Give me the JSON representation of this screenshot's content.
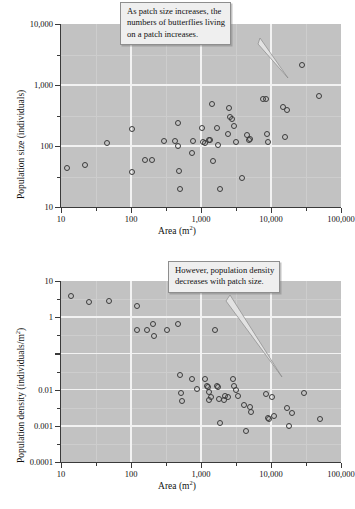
{
  "figure": {
    "panels": [
      {
        "id": "population-size-vs-area",
        "callout": {
          "lines": [
            "As patch size increases, the",
            "numbers of butterflies living",
            "on a patch increases."
          ]
        }
      },
      {
        "id": "population-density-vs-area",
        "callout": {
          "lines": [
            "However, population density",
            "decreases with patch size."
          ]
        }
      }
    ],
    "colors": {
      "plot_background": "#c2c2c2",
      "gridline": "#f2f2f2",
      "minor_gridline": "#cdcdcd",
      "marker_stroke": "#3c3c3c",
      "axis": "#3a3a3a",
      "callout_background": "#efefef",
      "callout_border": "#8e8e8e"
    }
  },
  "chart_data": [
    {
      "type": "scatter",
      "title": "",
      "xlabel": "Area (m2)",
      "xlabel_base": "Area (m",
      "xlabel_sup": "2",
      "xlabel_tail": ")",
      "ylabel": "Population size (individuals)",
      "xscale": "log",
      "yscale": "log",
      "xlim": [
        10,
        100000
      ],
      "ylim": [
        10,
        10000
      ],
      "grid": true,
      "legend": "none",
      "xticks": [
        10,
        100,
        1000,
        10000,
        100000
      ],
      "xticklabels": [
        "10",
        "100",
        "1,000",
        "10,000",
        "100,000"
      ],
      "yticks": [
        10,
        100,
        1000,
        10000
      ],
      "yticklabels": [
        "10",
        "100",
        "1,000",
        "10,000"
      ],
      "annotation": "As patch size increases, the numbers of butterflies living on a patch increases.",
      "points": [
        [
          12,
          43
        ],
        [
          22,
          48
        ],
        [
          45,
          110
        ],
        [
          102,
          190
        ],
        [
          105,
          38
        ],
        [
          160,
          60
        ],
        [
          200,
          59
        ],
        [
          300,
          120
        ],
        [
          430,
          120
        ],
        [
          465,
          240
        ],
        [
          470,
          100
        ],
        [
          490,
          39
        ],
        [
          500,
          20
        ],
        [
          740,
          78
        ],
        [
          780,
          120
        ],
        [
          1050,
          195
        ],
        [
          1080,
          118
        ],
        [
          1150,
          112
        ],
        [
          1300,
          124
        ],
        [
          1350,
          127
        ],
        [
          1450,
          480
        ],
        [
          1500,
          56
        ],
        [
          1700,
          195
        ],
        [
          1750,
          105
        ],
        [
          1850,
          20
        ],
        [
          2400,
          160
        ],
        [
          2500,
          420
        ],
        [
          2600,
          300
        ],
        [
          2750,
          275
        ],
        [
          3000,
          210
        ],
        [
          3200,
          118
        ],
        [
          3800,
          30
        ],
        [
          4600,
          150
        ],
        [
          4800,
          125
        ],
        [
          5000,
          128
        ],
        [
          7800,
          600
        ],
        [
          8600,
          590
        ],
        [
          8800,
          160
        ],
        [
          9000,
          118
        ],
        [
          15000,
          430
        ],
        [
          17000,
          395
        ],
        [
          16000,
          140
        ],
        [
          28000,
          2100
        ],
        [
          48000,
          660
        ]
      ]
    },
    {
      "type": "scatter",
      "title": "",
      "xlabel": "Area (m2)",
      "xlabel_base": "Area (m",
      "xlabel_sup": "2",
      "xlabel_tail": ")",
      "ylabel": "Population density (individuals/m2)",
      "ylabel_base": "Population density (individuals/m",
      "ylabel_sup": "2",
      "ylabel_tail": ")",
      "xscale": "log",
      "yscale": "log",
      "xlim": [
        10,
        100000
      ],
      "ylim": [
        0.0001,
        10
      ],
      "grid": true,
      "legend": "none",
      "xticks": [
        10,
        100,
        1000,
        10000,
        100000
      ],
      "xticklabels": [
        "10",
        "100",
        "1,000",
        "10,000",
        "100,000"
      ],
      "yticks": [
        10,
        1,
        0.1,
        0.01,
        0.001,
        0.0001
      ],
      "yticklabels": [
        "10",
        "1",
        "",
        "0.01",
        "0.001",
        "0.0001"
      ],
      "annotation": "However, population density decreases with patch size.",
      "points": [
        [
          14,
          3.8
        ],
        [
          25,
          2.7
        ],
        [
          49,
          2.8
        ],
        [
          120,
          2.0
        ],
        [
          122,
          0.43
        ],
        [
          170,
          0.44
        ],
        [
          205,
          0.65
        ],
        [
          215,
          0.31
        ],
        [
          330,
          0.45
        ],
        [
          470,
          0.64
        ],
        [
          500,
          0.025
        ],
        [
          520,
          0.0082
        ],
        [
          540,
          0.0047
        ],
        [
          750,
          0.02
        ],
        [
          880,
          0.0104
        ],
        [
          1150,
          0.02
        ],
        [
          1200,
          0.0125
        ],
        [
          1250,
          0.0115
        ],
        [
          1300,
          0.0088
        ],
        [
          1320,
          0.0053
        ],
        [
          1400,
          0.0062
        ],
        [
          1600,
          0.43
        ],
        [
          1700,
          0.0128
        ],
        [
          1750,
          0.0115
        ],
        [
          1800,
          0.0055
        ],
        [
          1850,
          0.0012
        ],
        [
          2100,
          0.0052
        ],
        [
          2200,
          0.0066
        ],
        [
          2400,
          0.0063
        ],
        [
          2900,
          0.02
        ],
        [
          3000,
          0.0122
        ],
        [
          3200,
          0.0098
        ],
        [
          3400,
          0.0065
        ],
        [
          4100,
          0.0038
        ],
        [
          4400,
          0.00073
        ],
        [
          5000,
          0.0033
        ],
        [
          5200,
          0.0024
        ],
        [
          8600,
          0.0075
        ],
        [
          9000,
          0.0016
        ],
        [
          9500,
          0.0015
        ],
        [
          10500,
          0.0064
        ],
        [
          11000,
          0.0019
        ],
        [
          17000,
          0.0031
        ],
        [
          18000,
          0.00097
        ],
        [
          20000,
          0.0023
        ],
        [
          30000,
          0.0082
        ],
        [
          50000,
          0.0015
        ]
      ]
    }
  ]
}
